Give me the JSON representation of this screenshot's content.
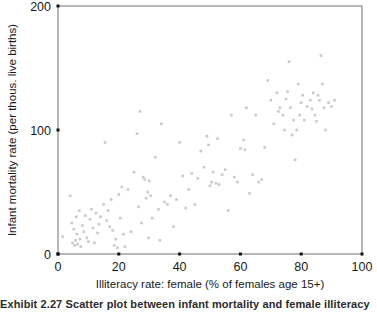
{
  "figure": {
    "caption": "Exhibit 2.27   Scatter plot between infant mortality and female illiteracy"
  },
  "chart_data": {
    "type": "scatter",
    "title": "",
    "xlabel": "Illiteracy rate: female (% of females age 15+)",
    "ylabel": "Infant mortality rate (per thous. live births)",
    "xlim": [
      0,
      100
    ],
    "ylim": [
      0,
      200
    ],
    "xticks": [
      0,
      20,
      40,
      60,
      80,
      100
    ],
    "yticks": [
      0,
      100,
      200
    ],
    "grid": false,
    "legend": "none",
    "marker_color": "#c9c9cf",
    "marker_shape": "square",
    "marker_size": 2.6,
    "n_points": 132,
    "points": [
      [
        1.5,
        14
      ],
      [
        4.0,
        47
      ],
      [
        4.5,
        25
      ],
      [
        4.8,
        9
      ],
      [
        5.2,
        20
      ],
      [
        5.5,
        7
      ],
      [
        5.8,
        11
      ],
      [
        6.0,
        30
      ],
      [
        6.2,
        16
      ],
      [
        6.5,
        8
      ],
      [
        7.0,
        35
      ],
      [
        7.2,
        12
      ],
      [
        7.5,
        6
      ],
      [
        8.0,
        23
      ],
      [
        8.5,
        18
      ],
      [
        9.0,
        31
      ],
      [
        9.5,
        13
      ],
      [
        10.0,
        10
      ],
      [
        10.5,
        28
      ],
      [
        11.0,
        36
      ],
      [
        11.5,
        21
      ],
      [
        12.0,
        9
      ],
      [
        12.5,
        33
      ],
      [
        13.0,
        17
      ],
      [
        13.5,
        24
      ],
      [
        14.0,
        30
      ],
      [
        15.0,
        40
      ],
      [
        15.5,
        90
      ],
      [
        16.0,
        27
      ],
      [
        16.5,
        35
      ],
      [
        17.0,
        22
      ],
      [
        17.5,
        44
      ],
      [
        18.0,
        19
      ],
      [
        18.5,
        7
      ],
      [
        19.0,
        12
      ],
      [
        19.5,
        5
      ],
      [
        20.0,
        48
      ],
      [
        20.5,
        29
      ],
      [
        21.0,
        54
      ],
      [
        21.5,
        16
      ],
      [
        22.0,
        6
      ],
      [
        23.0,
        52
      ],
      [
        24.0,
        18
      ],
      [
        25.0,
        66
      ],
      [
        26.0,
        97
      ],
      [
        26.5,
        38
      ],
      [
        27.0,
        115
      ],
      [
        27.5,
        25
      ],
      [
        28.0,
        62
      ],
      [
        28.5,
        60
      ],
      [
        29.0,
        45
      ],
      [
        29.5,
        50
      ],
      [
        29.8,
        13
      ],
      [
        30.0,
        59
      ],
      [
        30.5,
        47
      ],
      [
        31.0,
        29
      ],
      [
        32.0,
        78
      ],
      [
        33.0,
        36
      ],
      [
        33.5,
        11
      ],
      [
        34.0,
        105
      ],
      [
        35.0,
        42
      ],
      [
        36.0,
        40
      ],
      [
        38.0,
        22
      ],
      [
        39.0,
        44
      ],
      [
        40.0,
        90
      ],
      [
        41.0,
        63
      ],
      [
        42.0,
        37
      ],
      [
        44.0,
        65
      ],
      [
        46.0,
        61
      ],
      [
        47.0,
        83
      ],
      [
        48.0,
        70
      ],
      [
        49.0,
        95
      ],
      [
        49.5,
        88
      ],
      [
        50.0,
        55
      ],
      [
        50.5,
        58
      ],
      [
        51.0,
        66
      ],
      [
        52.0,
        57
      ],
      [
        52.5,
        93
      ],
      [
        53.0,
        56
      ],
      [
        54.0,
        64
      ],
      [
        56.0,
        35
      ],
      [
        57.0,
        112
      ],
      [
        58.0,
        62
      ],
      [
        59.0,
        58
      ],
      [
        60.0,
        85
      ],
      [
        61.0,
        92
      ],
      [
        61.5,
        84
      ],
      [
        62.0,
        118
      ],
      [
        63.0,
        49
      ],
      [
        64.0,
        64
      ],
      [
        65.0,
        112
      ],
      [
        66.0,
        58
      ],
      [
        67.0,
        60
      ],
      [
        68.0,
        86
      ],
      [
        69.0,
        140
      ],
      [
        70.0,
        124
      ],
      [
        71.0,
        105
      ],
      [
        72.0,
        130
      ],
      [
        72.5,
        115
      ],
      [
        73.0,
        118
      ],
      [
        74.0,
        112
      ],
      [
        74.5,
        100
      ],
      [
        75.0,
        125
      ],
      [
        75.5,
        131
      ],
      [
        76.0,
        155
      ],
      [
        76.5,
        118
      ],
      [
        77.0,
        96
      ],
      [
        77.5,
        108
      ],
      [
        78.0,
        76
      ],
      [
        78.5,
        100
      ],
      [
        79.0,
        137
      ],
      [
        79.5,
        112
      ],
      [
        80.0,
        122
      ],
      [
        80.5,
        128
      ],
      [
        81.0,
        108
      ],
      [
        82.0,
        119
      ],
      [
        83.0,
        124
      ],
      [
        83.5,
        117
      ],
      [
        84.0,
        130
      ],
      [
        84.5,
        112
      ],
      [
        85.0,
        107
      ],
      [
        85.5,
        128
      ],
      [
        86.0,
        124
      ],
      [
        86.5,
        160
      ],
      [
        87.0,
        137
      ],
      [
        87.5,
        118
      ],
      [
        88.0,
        100
      ],
      [
        89.0,
        122
      ],
      [
        90.0,
        119
      ],
      [
        91.0,
        124
      ],
      [
        55.0,
        68
      ],
      [
        43.0,
        52
      ],
      [
        37.0,
        47
      ],
      [
        45.0,
        40
      ]
    ]
  }
}
